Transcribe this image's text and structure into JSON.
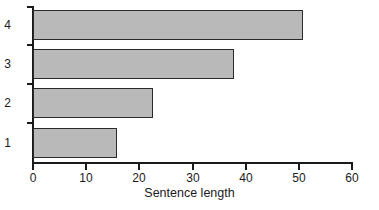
{
  "chart_data": {
    "type": "bar",
    "orientation": "horizontal",
    "title": "",
    "subtitle": "",
    "xlabel": "Sentence length",
    "ylabel": "",
    "categories": [
      "1",
      "2",
      "3",
      "4"
    ],
    "values": [
      15.8,
      22.6,
      37.8,
      50.8
    ],
    "series": [
      {
        "name": "Sentence length",
        "values": [
          15.8,
          22.6,
          37.8,
          50.8
        ]
      }
    ],
    "xlim": [
      0,
      60
    ],
    "xticks": [
      0,
      10,
      20,
      30,
      40,
      50,
      60
    ],
    "xtick_labels": [
      "0",
      "10",
      "20",
      "30",
      "40",
      "50",
      "60"
    ],
    "ytick_labels": [
      "1",
      "2",
      "3",
      "4"
    ],
    "grid": false,
    "legend": false,
    "legend_position": "none",
    "bar_fill_color": "#b9b9b9",
    "bar_edge_color": "#2b2b2b",
    "axis_color": "#1a1a1a",
    "background_color": "#ffffff"
  },
  "axes": {
    "x_title": "Sentence length",
    "x_ticks": [
      "0",
      "10",
      "20",
      "30",
      "40",
      "50",
      "60"
    ],
    "y_ticks": [
      "1",
      "2",
      "3",
      "4"
    ]
  },
  "bars": [
    {
      "category": "1",
      "value": 15.8
    },
    {
      "category": "2",
      "value": 22.6
    },
    {
      "category": "3",
      "value": 37.8
    },
    {
      "category": "4",
      "value": 50.8
    }
  ]
}
